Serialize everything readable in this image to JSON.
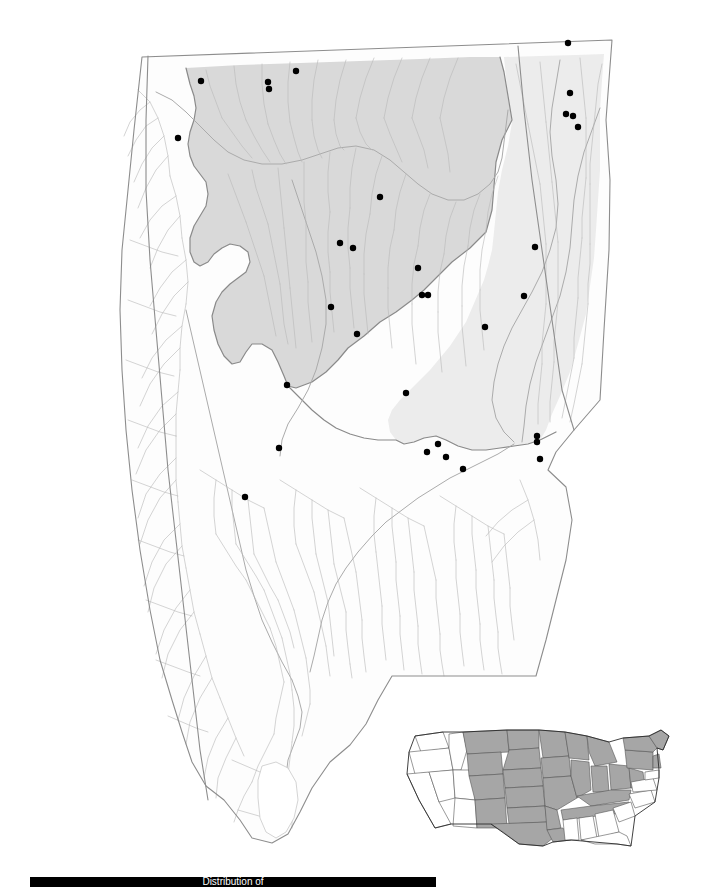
{
  "figure": {
    "type": "distribution-map",
    "subject_area": "Alabama",
    "caption": "Distribution of",
    "caption_emphasis": "",
    "bar_color": "#000000"
  },
  "legend_colors": {
    "highland_province": "#d9d9d9",
    "secondary_province": "#ececec",
    "lowland_background": "#fdfdfd",
    "river_line": "#b9b9b9",
    "state_outline": "#8d8d8d",
    "record_dot": "#000000",
    "inset_shaded_state": "#a6a6a6",
    "inset_unshaded_state": "#ffffff"
  },
  "main_map": {
    "name": "alabama-drainage-map",
    "record_dots": [
      {
        "x": 201,
        "y": 81
      },
      {
        "x": 268,
        "y": 82
      },
      {
        "x": 269,
        "y": 89
      },
      {
        "x": 296,
        "y": 71
      },
      {
        "x": 568,
        "y": 43
      },
      {
        "x": 570,
        "y": 93
      },
      {
        "x": 566,
        "y": 114
      },
      {
        "x": 573,
        "y": 116
      },
      {
        "x": 578,
        "y": 127
      },
      {
        "x": 178,
        "y": 138
      },
      {
        "x": 380,
        "y": 197
      },
      {
        "x": 340,
        "y": 243
      },
      {
        "x": 353,
        "y": 248
      },
      {
        "x": 418,
        "y": 268
      },
      {
        "x": 535,
        "y": 247
      },
      {
        "x": 422,
        "y": 295
      },
      {
        "x": 428,
        "y": 295
      },
      {
        "x": 331,
        "y": 307
      },
      {
        "x": 524,
        "y": 296
      },
      {
        "x": 357,
        "y": 334
      },
      {
        "x": 485,
        "y": 327
      },
      {
        "x": 287,
        "y": 385
      },
      {
        "x": 406,
        "y": 393
      },
      {
        "x": 279,
        "y": 448
      },
      {
        "x": 438,
        "y": 444
      },
      {
        "x": 427,
        "y": 452
      },
      {
        "x": 446,
        "y": 457
      },
      {
        "x": 537,
        "y": 436
      },
      {
        "x": 537,
        "y": 442
      },
      {
        "x": 540,
        "y": 459
      },
      {
        "x": 463,
        "y": 469
      },
      {
        "x": 245,
        "y": 497
      }
    ]
  },
  "inset_map": {
    "name": "us-range-inset",
    "shaded_states": [
      "Washington",
      "Montana",
      "North Dakota",
      "Minnesota",
      "Wisconsin",
      "Michigan",
      "Idaho",
      "Wyoming",
      "South Dakota",
      "Iowa",
      "Illinois",
      "Indiana",
      "Ohio",
      "Nebraska",
      "Kansas",
      "Missouri",
      "Kentucky",
      "West Virginia",
      "Pennsylvania",
      "New York",
      "Vermont",
      "New Hampshire",
      "Maine",
      "Massachusetts",
      "Connecticut",
      "Rhode Island",
      "New Jersey",
      "Oklahoma",
      "Arkansas",
      "Tennessee",
      "Texas",
      "Louisiana",
      "Colorado",
      "New Mexico"
    ],
    "unshaded_states": [
      "Oregon",
      "California",
      "Nevada",
      "Utah",
      "Arizona",
      "Virginia",
      "North Carolina",
      "South Carolina",
      "Georgia",
      "Alabama",
      "Mississippi",
      "Florida",
      "Maryland",
      "Delaware"
    ]
  }
}
